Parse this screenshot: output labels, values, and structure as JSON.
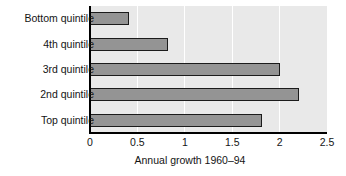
{
  "chart_data": {
    "type": "bar",
    "orientation": "horizontal",
    "title": "",
    "xlabel": "Annual growth 1960–94",
    "ylabel": "",
    "categories": [
      "Bottom quintile",
      "4th quintile",
      "3rd quintile",
      "2nd quintile",
      "Top quintile"
    ],
    "values": [
      0.41,
      0.82,
      2.0,
      2.2,
      1.81
    ],
    "xlim": [
      0,
      2.5
    ],
    "xticks": [
      0,
      0.5,
      1,
      1.5,
      2,
      2.5
    ],
    "xtick_labels": [
      "0",
      "0.5",
      "1",
      "1.5",
      "2",
      "2.5"
    ],
    "grid": true,
    "grid_axis": "x",
    "legend": false,
    "legend_position": "none",
    "bar_color": "#949494",
    "bar_edge_color": "#1b1b1b",
    "plot_background": "#e9e9e9",
    "figure_background": "#ffffff",
    "gridline_color": "#ffffff",
    "axis_color": "#000000",
    "text_color": "#141414"
  },
  "axis": {
    "x_title": "Annual growth 1960–94"
  },
  "ylabels": {
    "0": "Bottom quintile",
    "1": "4th quintile",
    "2": "3rd quintile",
    "3": "2nd quintile",
    "4": "Top quintile"
  },
  "xticks": {
    "0": "0",
    "1": "0.5",
    "2": "1",
    "3": "1.5",
    "4": "2",
    "5": "2.5"
  }
}
